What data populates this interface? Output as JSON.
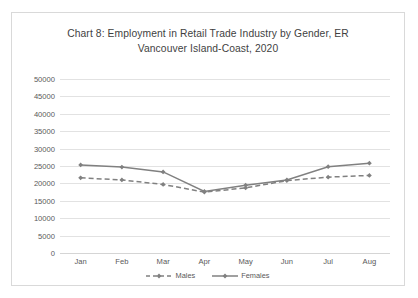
{
  "chart_data": {
    "type": "line",
    "title": "Chart 8: Employment in Retail Trade Industry by Gender, ER Vancouver Island-Coast, 2020",
    "title_line1": "Chart 8: Employment in Retail Trade Industry by Gender, ER",
    "title_line2": "Vancouver Island-Coast, 2020",
    "categories": [
      "Jan",
      "Feb",
      "Mar",
      "Apr",
      "May",
      "Jun",
      "Jul",
      "Aug"
    ],
    "series": [
      {
        "name": "Males",
        "values": [
          21600,
          21000,
          19700,
          17500,
          18700,
          20800,
          21800,
          22300
        ],
        "color": "#808080",
        "style": "dashed",
        "marker": "diamond"
      },
      {
        "name": "Females",
        "values": [
          25300,
          24700,
          23300,
          17700,
          19500,
          21000,
          24800,
          25800
        ],
        "color": "#808080",
        "style": "solid",
        "marker": "diamond"
      }
    ],
    "ylim": [
      0,
      50000
    ],
    "yticks": [
      0,
      5000,
      10000,
      15000,
      20000,
      25000,
      30000,
      35000,
      40000,
      45000,
      50000
    ],
    "ytick_labels": [
      "0",
      "5000",
      "10000",
      "15000",
      "20000",
      "25000",
      "30000",
      "35000",
      "40000",
      "45000",
      "50000"
    ],
    "xlabel": "",
    "ylabel": "",
    "grid": true,
    "legend_position": "bottom"
  }
}
